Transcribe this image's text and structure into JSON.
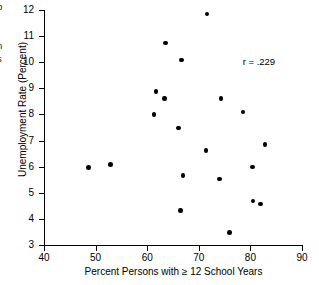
{
  "chart_data": {
    "type": "scatter",
    "title": "",
    "xlabel": "Percent Persons with ≥ 12 School Years",
    "ylabel": "Unemployment Rate (Percent)",
    "xlim": [
      40,
      90
    ],
    "ylim": [
      3,
      12
    ],
    "xticks": [
      "40",
      "50",
      "60",
      "70",
      "80",
      "90"
    ],
    "yticks": [
      "3",
      "4",
      "5",
      "6",
      "7",
      "8",
      "9",
      "10",
      "11",
      "12"
    ],
    "grid": false,
    "legend": "none",
    "annotations": [
      {
        "name": "correlation-coefficient",
        "text": "r = .229",
        "x": 78.5,
        "y": 10.05
      }
    ],
    "points": [
      {
        "x": 48.6,
        "y": 5.97
      },
      {
        "x": 52.9,
        "y": 6.08
      },
      {
        "x": 61.3,
        "y": 8.0
      },
      {
        "x": 61.7,
        "y": 8.88
      },
      {
        "x": 63.4,
        "y": 8.61
      },
      {
        "x": 63.6,
        "y": 10.73
      },
      {
        "x": 66.1,
        "y": 7.48
      },
      {
        "x": 66.4,
        "y": 4.33
      },
      {
        "x": 66.7,
        "y": 10.08
      },
      {
        "x": 66.9,
        "y": 5.67
      },
      {
        "x": 71.4,
        "y": 6.61
      },
      {
        "x": 71.6,
        "y": 11.85
      },
      {
        "x": 74.0,
        "y": 5.53
      },
      {
        "x": 74.3,
        "y": 8.6
      },
      {
        "x": 75.9,
        "y": 3.47
      },
      {
        "x": 78.6,
        "y": 8.1
      },
      {
        "x": 80.4,
        "y": 5.98
      },
      {
        "x": 80.5,
        "y": 4.68
      },
      {
        "x": 82.0,
        "y": 4.57
      },
      {
        "x": 82.8,
        "y": 6.86
      }
    ]
  },
  "caption_fragments": {
    "line_1": "p",
    "line_2": "n",
    "line_3": "s"
  }
}
